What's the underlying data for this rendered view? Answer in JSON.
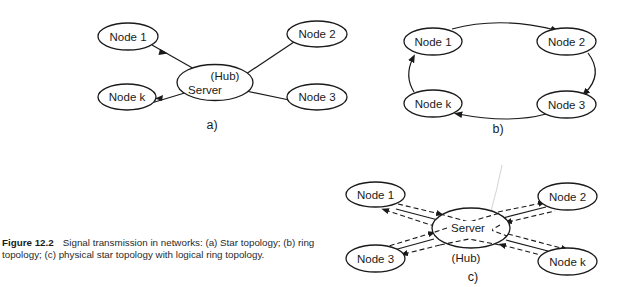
{
  "diagrams": {
    "a": {
      "sublabel": "a)",
      "server": {
        "label": "Server",
        "sublabel": "(Hub)"
      },
      "nodes": {
        "n1": "Node 1",
        "n2": "Node 2",
        "n3": "Node 3",
        "nk": "Node k"
      },
      "topology": "star"
    },
    "b": {
      "sublabel": "b)",
      "nodes": {
        "n1": "Node 1",
        "n2": "Node 2",
        "n3": "Node 3",
        "nk": "Node k"
      },
      "topology": "ring"
    },
    "c": {
      "sublabel": "c)",
      "server": {
        "label": "Server",
        "sublabel": "(Hub)"
      },
      "nodes": {
        "n1": "Node 1",
        "n2": "Node 2",
        "n3": "Node 3",
        "nk": "Node k"
      },
      "topology": "physical star with logical ring"
    }
  },
  "caption": {
    "figure_label": "Figure 12.2",
    "text": "Signal transmission in networks: (a) Star topology; (b) ring topology; (c) physical star topology with logical ring topology."
  }
}
